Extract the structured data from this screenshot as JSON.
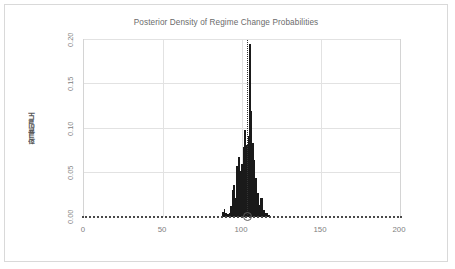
{
  "chart_data": {
    "type": "bar",
    "title": "Posterior Density of Regime Change Probabilities",
    "xlabel": "",
    "ylabel": "확률밀도",
    "xlim": [
      0,
      200
    ],
    "ylim": [
      0,
      0.2
    ],
    "xticks": [
      "0",
      "50",
      "100",
      "150",
      "200"
    ],
    "xtick_values": [
      0,
      50,
      100,
      150,
      200
    ],
    "yticks": [
      "0.00",
      "0.05",
      "0.10",
      "0.15",
      "0.20"
    ],
    "ytick_values": [
      0.0,
      0.05,
      0.1,
      0.15,
      0.2
    ],
    "grid": true,
    "legend": null,
    "series_name": "posterior density",
    "bar_color": "#1a1a1a",
    "annotation": {
      "vertical_line_x": 103,
      "vertical_line_style": "dotted",
      "marker_x": 103,
      "marker_y": 0.0,
      "marker_shape": "circle-open"
    },
    "baseline_style": "dotted",
    "x": [
      86,
      87,
      88,
      89,
      90,
      91,
      92,
      93,
      94,
      95,
      96,
      97,
      98,
      99,
      100,
      101,
      102,
      103,
      104,
      105,
      106,
      107,
      108,
      109,
      110,
      111,
      112,
      113,
      114,
      115,
      116,
      117,
      118,
      119,
      120,
      121,
      122
    ],
    "values": [
      0.0,
      0.0,
      0.006,
      0.009,
      0.005,
      0.003,
      0.004,
      0.012,
      0.03,
      0.036,
      0.021,
      0.058,
      0.068,
      0.052,
      0.06,
      0.079,
      0.098,
      0.081,
      0.092,
      0.195,
      0.12,
      0.084,
      0.064,
      0.044,
      0.027,
      0.014,
      0.022,
      0.021,
      0.008,
      0.004,
      0.005,
      0.002,
      0.001,
      0.0,
      0.0,
      0.0,
      0.0
    ]
  },
  "frame": {
    "background": "#ffffff",
    "border_color": "#d9d9d9"
  }
}
